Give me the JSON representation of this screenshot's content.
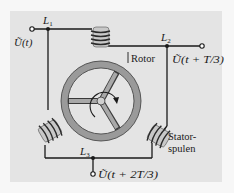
{
  "diagram": {
    "colors": {
      "page_bg": "#f7f7f7",
      "panel_bg": "#e4e4e4",
      "wire": "#1a1a1a",
      "rotor_ring": "#9a9a9a",
      "rotor_ring_edge": "#3a3a3a",
      "coil_fill": "#c8c8c8",
      "coil_winding": "#2a2a2a"
    },
    "nodes": {
      "L1": {
        "label": "L",
        "sub": "1"
      },
      "L2": {
        "label": "L",
        "sub": "2"
      },
      "L3": {
        "label": "L",
        "sub": "3"
      }
    },
    "voltages": {
      "u1": {
        "symbol": "Ũ",
        "arg": "(t)"
      },
      "u2": {
        "symbol": "Ũ",
        "arg": "(t + T/3)"
      },
      "u3": {
        "symbol": "Ũ",
        "arg": "(t + 2T/3)"
      }
    },
    "labels": {
      "rotor": "Rotor",
      "stator_line1": "Stator-",
      "stator_line2": "spulen"
    },
    "components": [
      {
        "name": "stator-coil-top"
      },
      {
        "name": "stator-coil-left"
      },
      {
        "name": "stator-coil-right"
      },
      {
        "name": "rotor-wheel",
        "spokes": 3,
        "rotation_arrow": "clockwise"
      }
    ]
  }
}
